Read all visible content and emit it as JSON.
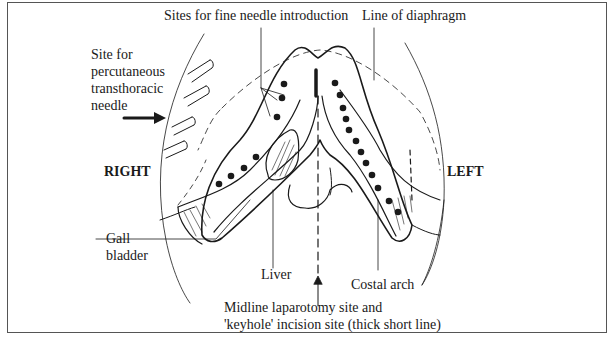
{
  "diagram": {
    "type": "anatomical illustration",
    "labels": {
      "fine_needle": "Sites for fine needle introduction",
      "diaphragm": "Line of diaphragm",
      "transthoracic": [
        "Site for",
        "percutaneous",
        "transthoracic",
        "needle"
      ],
      "right": "RIGHT",
      "left": "LEFT",
      "gall_bladder": [
        "Gall",
        "bladder"
      ],
      "liver": "Liver",
      "costal_arch": "Costal arch",
      "midline": [
        "Midline laparotomy site and",
        "'keyhole' incision site (thick short line)"
      ]
    },
    "colors": {
      "ink": "#1a1a1a",
      "frame": "#555555",
      "background": "#ffffff"
    }
  }
}
